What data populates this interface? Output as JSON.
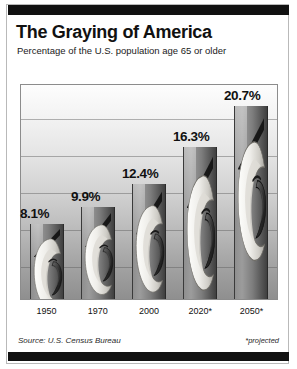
{
  "header": {
    "title": "The Graying of America",
    "subtitle": "Percentage of the U.S. population age 65 or older"
  },
  "footer": {
    "source": "Source: U.S. Census Bureau",
    "note": "*projected"
  },
  "colors": {
    "rule": "#111111",
    "frame": "#8c8c8c",
    "bar_dark": "#3f3f3f",
    "bar_light": "#9c9c9c",
    "text": "#111111"
  },
  "chart_data": {
    "type": "bar",
    "title": "The Graying of America",
    "subtitle": "Percentage of the U.S. population age 65 or older",
    "categories": [
      "1950",
      "1970",
      "2000",
      "2020*",
      "2050*"
    ],
    "values": [
      8.1,
      9.9,
      12.4,
      16.3,
      20.7
    ],
    "value_labels": [
      "8.1%",
      "9.9%",
      "12.4%",
      "16.3%",
      "20.7%"
    ],
    "xlabel": "",
    "ylabel": "Percentage of the U.S. population age 65 or older",
    "ylim": [
      0,
      23
    ],
    "grid": true,
    "gridlines": [
      4,
      8,
      12,
      16,
      20
    ],
    "legend": "none",
    "annotations": [
      "*projected"
    ],
    "source": "Source: U.S. Census Bureau"
  },
  "bars": [
    {
      "label": "1950",
      "value_label": "8.1%",
      "value": 8.1
    },
    {
      "label": "1970",
      "value_label": "9.9%",
      "value": 9.9
    },
    {
      "label": "2000",
      "value_label": "12.4%",
      "value": 12.4
    },
    {
      "label": "2020*",
      "value_label": "16.3%",
      "value": 16.3
    },
    {
      "label": "2050*",
      "value_label": "20.7%",
      "value": 20.7
    }
  ]
}
